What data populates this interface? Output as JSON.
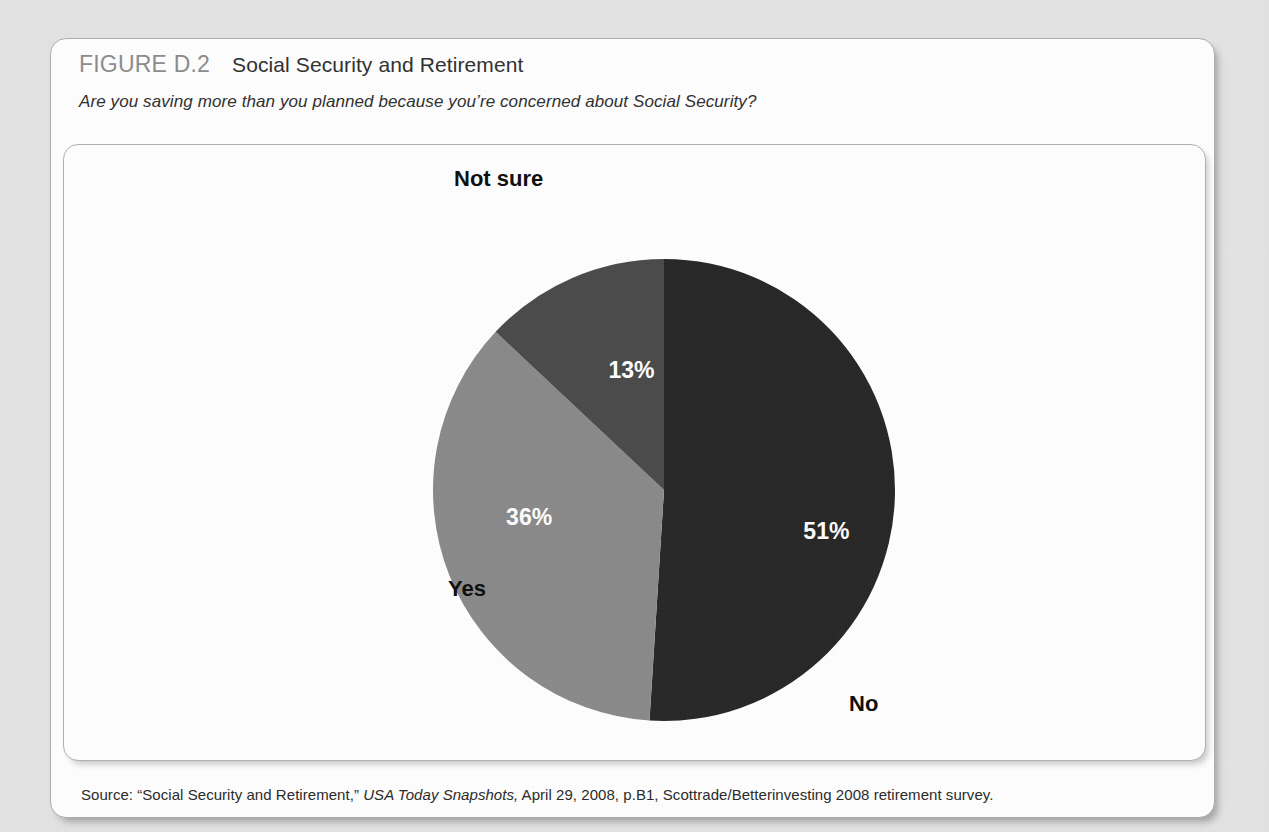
{
  "figure": {
    "number": "FIGURE D.2",
    "title": "Social Security and Retirement",
    "question": "Are you saving more than you planned because you’re concerned about Social Security?",
    "source_prefix": "Source: “Social Security and Retirement,” ",
    "source_italic": "USA Today Snapshots,",
    "source_suffix": " April 29, 2008, p.B1, Scottrade/Betterinvesting 2008 retirement survey."
  },
  "chart_data": {
    "type": "pie",
    "title": "Social Security and Retirement",
    "subtitle": "Are you saving more than you planned because you’re concerned about Social Security?",
    "categories": [
      "No",
      "Yes",
      "Not sure"
    ],
    "values": [
      51,
      36,
      13
    ],
    "value_labels": [
      "51%",
      "36%",
      "13%"
    ],
    "colors": [
      "#262626",
      "#8a8a8a",
      "#4a4a4a"
    ],
    "start_angle_deg": 0,
    "direction": "clockwise",
    "legend": "none",
    "labels_inside": true,
    "xlabel": "",
    "ylabel": ""
  },
  "geometry": {
    "center_x": 600,
    "center_y": 345,
    "radius": 231,
    "pct_label_radius": 0.62,
    "cat_label_radius": 1.17
  }
}
